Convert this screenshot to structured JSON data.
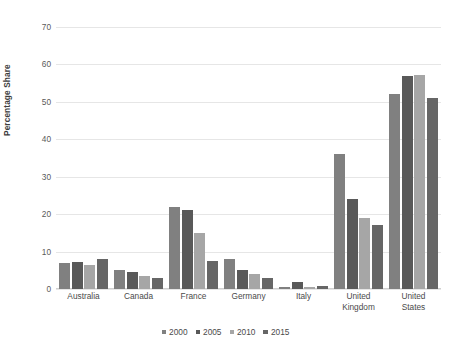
{
  "chart_data": {
    "type": "bar",
    "title": "",
    "xlabel": "",
    "ylabel": "Percentage Share",
    "ylim": [
      0,
      70
    ],
    "yticks": [
      0,
      10,
      20,
      30,
      40,
      50,
      60,
      70
    ],
    "ytick_labels": [
      "0",
      "10",
      "20",
      "30",
      "40",
      "50",
      "60",
      "70"
    ],
    "grid": true,
    "legend_position": "bottom",
    "categories": [
      "Australia",
      "Canada",
      "France",
      "Germany",
      "Italy",
      "United Kingdom",
      "United States"
    ],
    "category_lines": [
      [
        "Australia"
      ],
      [
        "Canada"
      ],
      [
        "France"
      ],
      [
        "Germany"
      ],
      [
        "Italy"
      ],
      [
        "United",
        "Kingdom"
      ],
      [
        "United",
        "States"
      ]
    ],
    "series": [
      {
        "name": "2000",
        "color": "#808080",
        "values": [
          7.0,
          5.0,
          22.0,
          8.0,
          0.5,
          36.0,
          52.0
        ]
      },
      {
        "name": "2005",
        "color": "#595959",
        "values": [
          7.1,
          4.5,
          21.2,
          5.2,
          2.0,
          24.0,
          57.0
        ]
      },
      {
        "name": "2010",
        "color": "#a6a6a6",
        "values": [
          6.5,
          3.4,
          15.0,
          4.1,
          0.5,
          19.0,
          57.2
        ]
      },
      {
        "name": "2015",
        "color": "#666666",
        "values": [
          8.0,
          2.9,
          7.5,
          3.0,
          0.9,
          17.0,
          51.0
        ]
      }
    ]
  },
  "colors": {
    "gridline": "#e6e6e6",
    "axis": "#d0d0d0",
    "tick_text": "#5a5a5a",
    "label_text": "#4a4a4a",
    "axis_title_text": "#3d3d3d",
    "background": "#ffffff"
  }
}
